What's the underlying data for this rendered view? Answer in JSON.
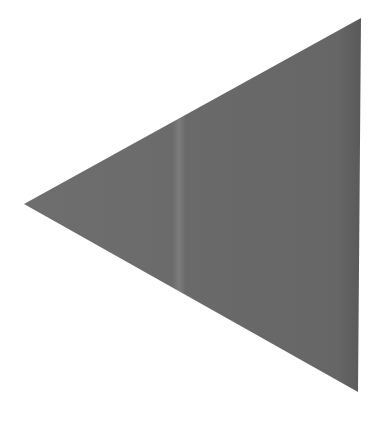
{
  "image": {
    "background": "#ffffff",
    "shape": {
      "type": "triangle",
      "direction": "left",
      "points": [
        [
          361,
          18
        ],
        [
          358,
          392
        ],
        [
          24,
          204
        ]
      ],
      "fill": "#6a6a6a",
      "edge_shade": "#5c5c5c",
      "streak": {
        "x": 180,
        "width": 10,
        "color": "#7a7a7a"
      }
    }
  }
}
